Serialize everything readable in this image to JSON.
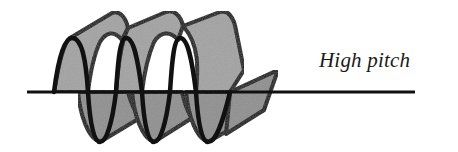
{
  "diagram": {
    "label": "High pitch",
    "colors": {
      "fill": "#8f8f8f",
      "fill_back": "#a3a3a3",
      "stroke": "#111111",
      "axis": "#111111",
      "background": "#ffffff"
    }
  }
}
